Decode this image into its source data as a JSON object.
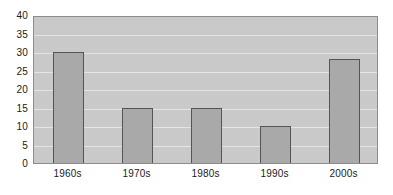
{
  "chart_data": {
    "type": "bar",
    "title": "",
    "subtitle": "",
    "xlabel": "",
    "ylabel": "",
    "categories": [
      "1960s",
      "1970s",
      "1980s",
      "1990s",
      "2000s"
    ],
    "values": [
      30,
      15,
      15,
      10,
      28
    ],
    "ylim": [
      0,
      40
    ],
    "yticks": [
      0,
      5,
      10,
      15,
      20,
      25,
      30,
      35,
      40
    ],
    "ytick_labels": [
      "0",
      "5",
      "10",
      "15",
      "20",
      "25",
      "30",
      "35",
      "40"
    ],
    "grid": true,
    "grid_axis": "y",
    "legend": false,
    "legend_position": "none",
    "annotations": [],
    "colors": {
      "bar_fill": "#a9a9a9",
      "bar_border": "#555555",
      "plot_background": "#c9c9c9",
      "plot_border": "#8c8c8c",
      "gridline": "#e4e4e4",
      "page_background": "#ffffff",
      "text": "#1a1a1a"
    }
  }
}
